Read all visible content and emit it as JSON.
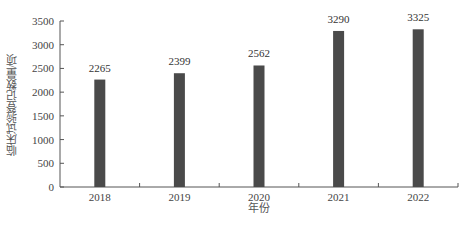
{
  "chart_data": {
    "type": "bar",
    "title": "",
    "xlabel": "年份",
    "ylabel": "临床试验登记数量/项",
    "categories": [
      "2018",
      "2019",
      "2020",
      "2021",
      "2022"
    ],
    "values": [
      2265,
      2399,
      2562,
      3290,
      3325
    ],
    "data_labels": [
      "2265",
      "2399",
      "2562",
      "3290",
      "3325"
    ],
    "ylim": [
      0,
      3500
    ],
    "yticks": [
      0,
      500,
      1000,
      1500,
      2000,
      2500,
      3000,
      3500
    ],
    "grid": false,
    "legend": null,
    "bar_color": "#4a4a4a"
  }
}
